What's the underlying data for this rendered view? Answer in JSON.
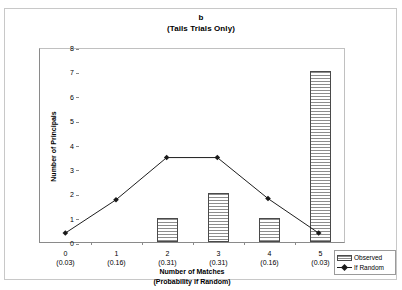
{
  "chart_data": {
    "type": "bar",
    "title": "b",
    "subtitle": "(Tails Trials Only)",
    "xlabel": "Number of Matches",
    "xlabel_line2": "(Probability if Random)",
    "ylabel": "Number of Principals",
    "categories": [
      "0",
      "1",
      "2",
      "3",
      "4",
      "5"
    ],
    "category_sublabels": [
      "(0.03)",
      "(0.16)",
      "(0.31)",
      "(0.31)",
      "(0.16)",
      "(0.03)"
    ],
    "ylim": [
      0,
      8
    ],
    "ytick_labels": [
      "0",
      "1",
      "2",
      "3",
      "4",
      "5",
      "6",
      "7",
      "8"
    ],
    "ytick_values": [
      0,
      1,
      2,
      3,
      4,
      5,
      6,
      7,
      8
    ],
    "grid": false,
    "legend_position": "bottom-right",
    "series": [
      {
        "name": "Observed",
        "render": "bar",
        "values": [
          0,
          0,
          1,
          2,
          1,
          7
        ],
        "color": "#8d8d8d",
        "border_color": "#4a4a4a"
      },
      {
        "name": "If Random",
        "render": "line",
        "values": [
          0.37,
          1.75,
          3.5,
          3.5,
          1.8,
          0.37
        ],
        "color": "#1a1a1a",
        "marker": "diamond"
      }
    ]
  },
  "legend": {
    "items": [
      {
        "label": "Observed"
      },
      {
        "label": "If Random"
      }
    ]
  }
}
